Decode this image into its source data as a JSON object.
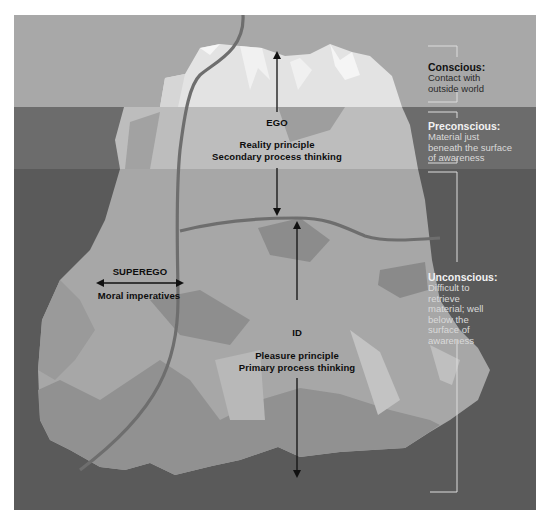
{
  "colors": {
    "page_bg": "#ffffff",
    "sky": "#a8a8a8",
    "water_upper": "#6c6c6c",
    "water_lower": "#5a5a5a",
    "ice_top_light": "#e6e6e6",
    "ice_top_white": "#f4f4f4",
    "ice_upper_band": "#bdbdbd",
    "ice_mid": "#a7a7a7",
    "ice_lower": "#959595",
    "ice_shadow": "#7d7d7d",
    "boundary_line": "#6e6e6e",
    "arrow": "#111111",
    "label_dark": "#0d0d0d",
    "label_conscious": "#111111",
    "label_light": "#ececec",
    "bracket": "#dcdcdc"
  },
  "structures": {
    "ego": {
      "name": "EGO",
      "line1": "Reality principle",
      "line2": "Secondary process thinking"
    },
    "superego": {
      "name": "SUPEREGO",
      "line1": "Moral imperatives"
    },
    "id": {
      "name": "ID",
      "line1": "Pleasure principle",
      "line2": "Primary process thinking"
    }
  },
  "levels": [
    {
      "title": "Conscious:",
      "body": "Contact with outside world"
    },
    {
      "title": "Preconscious:",
      "body": "Material just beneath the surface of awareness"
    },
    {
      "title": "Unconscious:",
      "body": "Difficult to retrieve material; well below the surface of awareness"
    }
  ]
}
